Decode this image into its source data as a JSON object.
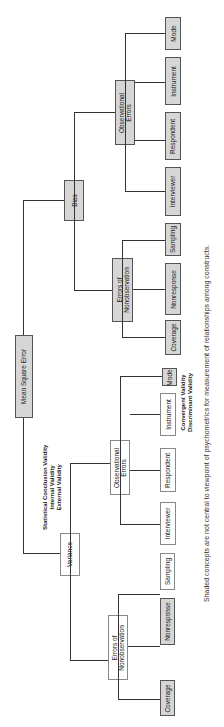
{
  "root": {
    "label": "Mean Square Error"
  },
  "bias": {
    "label": "Bias",
    "observational": {
      "label": "Observational\nErrors",
      "leaves": [
        "Interviewer",
        "Respondent",
        "Instrument",
        "Mode"
      ]
    },
    "nonobservation": {
      "label": "Errors of\nNonobservation",
      "leaves": [
        "Coverage",
        "Nonresponse",
        "Sampling"
      ]
    }
  },
  "variance": {
    "label": "Variance",
    "observational": {
      "label": "Observational\nErrors",
      "leaves": [
        "Interviewer",
        "Respondent",
        "Instrument",
        "Mode"
      ]
    },
    "nonobservation": {
      "label": "Errors of\nNonobservation",
      "leaves": [
        "Coverage",
        "Nonresponse",
        "Sampling"
      ]
    }
  },
  "annotations": {
    "variance_validity": [
      "Statistical Conclusion Validity",
      "Internal Validity",
      "External Validity"
    ],
    "instrument_validity": [
      "Convergent Validity",
      "Discriminant Validity"
    ]
  },
  "caption": "Shaded concepts are not central to viewpoint of psychometrics for measurement of relationships among constructs."
}
